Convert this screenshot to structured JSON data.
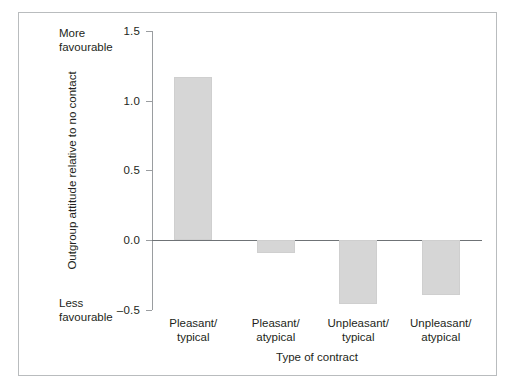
{
  "figure": {
    "background": "#ffffff",
    "frame_color": "#b9bcbe"
  },
  "annotations": {
    "more_favourable_line1": "More",
    "more_favourable_line2": "favourable",
    "less_favourable_line1": "Less",
    "less_favourable_line2": "favourable"
  },
  "axis": {
    "y_title": "Outgroup attitude relative to no contact",
    "x_title": "Type of contract",
    "y_ticks": [
      "1.5",
      "1.0",
      "0.5",
      "0.0",
      "–0.5"
    ]
  },
  "chart_data": {
    "type": "bar",
    "title": "",
    "xlabel": "Type of contract",
    "ylabel": "Outgroup attitude relative to no contact",
    "categories": [
      "Pleasant/\ntypical",
      "Pleasant/\natypical",
      "Unpleasant/\ntypical",
      "Unpleasant/\natypical"
    ],
    "category_lines": [
      [
        "Pleasant/",
        "typical"
      ],
      [
        "Pleasant/",
        "atypical"
      ],
      [
        "Unpleasant/",
        "typical"
      ],
      [
        "Unpleasant/",
        "atypical"
      ]
    ],
    "values": [
      1.17,
      -0.09,
      -0.46,
      -0.39
    ],
    "ylim": [
      -0.5,
      1.5
    ],
    "yticks": [
      1.5,
      1.0,
      0.5,
      0.0,
      -0.5
    ],
    "grid": false,
    "legend": "none",
    "bar_color": "#d6d6d6",
    "baseline": 0.0,
    "axis_annotations": {
      "top": "More favourable",
      "bottom": "Less favourable"
    }
  }
}
